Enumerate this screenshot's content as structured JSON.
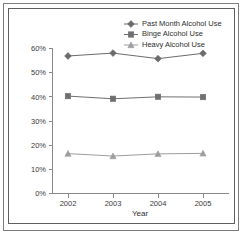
{
  "chart_data": {
    "type": "line",
    "title": "",
    "subtitle": "",
    "xlabel": "Year",
    "ylabel": "",
    "categories": [
      "2002",
      "2003",
      "2004",
      "2005"
    ],
    "x": [
      2002,
      2003,
      2004,
      2005
    ],
    "ylim": [
      0,
      60
    ],
    "yticks": [
      0,
      10,
      20,
      30,
      40,
      50,
      60
    ],
    "ytick_labels": [
      "0%",
      "10%",
      "20%",
      "30%",
      "40%",
      "50%",
      "60%"
    ],
    "xtick_labels": [
      "2002",
      "2003",
      "2004",
      "2005"
    ],
    "grid": false,
    "legend_position": "top-right",
    "value_suffix": "%",
    "series": [
      {
        "name": "Past Month Alcohol Use",
        "marker": "diamond",
        "color": "#6b6b6b",
        "values": [
          56.9,
          58.1,
          55.8,
          58.0
        ]
      },
      {
        "name": "Binge Alcohol Use",
        "marker": "square",
        "color": "#6f6f6f",
        "values": [
          40.3,
          39.2,
          40.0,
          39.9
        ]
      },
      {
        "name": "Heavy Alcohol Use",
        "marker": "triangle",
        "color": "#9e9e9e",
        "values": [
          16.5,
          15.5,
          16.4,
          16.6
        ]
      }
    ]
  },
  "figure": {
    "axis_color": "#8a8a8a",
    "frame_color": "#5f5f5f",
    "background": "#ffffff"
  }
}
